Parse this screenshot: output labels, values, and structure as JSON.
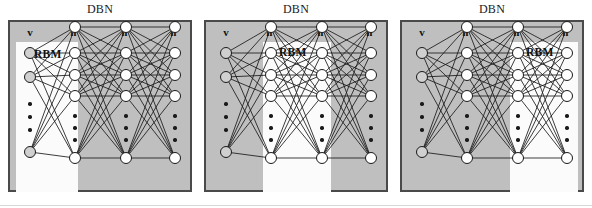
{
  "figure": {
    "width": 592,
    "height": 208,
    "background": "#ffffff",
    "caption_rule": true
  },
  "colors": {
    "panel_fill": "#bfbfbf",
    "panel_border": "#4a4a4a",
    "rbm_fill": "#fbfbfb",
    "visible_node_fill": "#d0d0d0",
    "hidden_node_fill": "#ffffff",
    "node_stroke": "#1a1a1a",
    "edge_stroke": "#1a1a1a",
    "text": "#111111"
  },
  "panels": [
    {
      "id": "panel-1",
      "title": "DBN",
      "rbm_label": "RBM",
      "rbm_span": [
        "v",
        "h1"
      ],
      "rbm_rect": {
        "x": 6,
        "y": 20,
        "w": 62,
        "h": 150
      },
      "rbm_label_pos": {
        "x": 24,
        "y": 26
      },
      "layers": [
        {
          "key": "v",
          "label": "v",
          "superscript": "",
          "x": 20,
          "type": "visible",
          "nodes_y": [
            31,
            55,
            130
          ],
          "dots_y": [
            82,
            95,
            108
          ]
        },
        {
          "key": "h1",
          "label": "h",
          "superscript": "1",
          "x": 65,
          "type": "hidden",
          "nodes_y": [
            5,
            31,
            53,
            74,
            136
          ],
          "dots_y": [
            94,
            106,
            118
          ]
        },
        {
          "key": "h2",
          "label": "h",
          "superscript": "2",
          "x": 116,
          "type": "hidden",
          "nodes_y": [
            5,
            31,
            53,
            74,
            136
          ],
          "dots_y": [
            94,
            106,
            118
          ]
        },
        {
          "key": "h3",
          "label": "h",
          "superscript": "3",
          "x": 165,
          "type": "hidden",
          "nodes_y": [
            5,
            31,
            53,
            74,
            136
          ],
          "dots_y": [
            94,
            106,
            118
          ]
        }
      ]
    },
    {
      "id": "panel-2",
      "title": "DBN",
      "rbm_label": "RBM",
      "rbm_span": [
        "h1",
        "h2"
      ],
      "rbm_rect": {
        "x": 57,
        "y": 20,
        "w": 68,
        "h": 150
      },
      "rbm_label_pos": {
        "x": 73,
        "y": 24
      },
      "layers": [
        {
          "key": "v",
          "label": "v",
          "superscript": "",
          "x": 20,
          "type": "visible",
          "nodes_y": [
            31,
            55,
            130
          ],
          "dots_y": [
            82,
            95,
            108
          ]
        },
        {
          "key": "h1",
          "label": "h",
          "superscript": "1",
          "x": 65,
          "type": "hidden",
          "nodes_y": [
            5,
            31,
            53,
            74,
            136
          ],
          "dots_y": [
            94,
            106,
            118
          ]
        },
        {
          "key": "h2",
          "label": "h",
          "superscript": "2",
          "x": 116,
          "type": "hidden",
          "nodes_y": [
            5,
            31,
            53,
            74,
            136
          ],
          "dots_y": [
            94,
            106,
            118
          ]
        },
        {
          "key": "h3",
          "label": "h",
          "superscript": "3",
          "x": 165,
          "type": "hidden",
          "nodes_y": [
            5,
            31,
            53,
            74,
            136
          ],
          "dots_y": [
            94,
            106,
            118
          ]
        }
      ]
    },
    {
      "id": "panel-3",
      "title": "DBN",
      "rbm_label": "RBM",
      "rbm_span": [
        "h2",
        "h3"
      ],
      "rbm_rect": {
        "x": 108,
        "y": 20,
        "w": 68,
        "h": 150
      },
      "rbm_label_pos": {
        "x": 124,
        "y": 24
      },
      "layers": [
        {
          "key": "v",
          "label": "v",
          "superscript": "",
          "x": 20,
          "type": "visible",
          "nodes_y": [
            31,
            55,
            130
          ],
          "dots_y": [
            82,
            95,
            108
          ]
        },
        {
          "key": "h1",
          "label": "h",
          "superscript": "1",
          "x": 65,
          "type": "hidden",
          "nodes_y": [
            5,
            31,
            53,
            74,
            136
          ],
          "dots_y": [
            94,
            106,
            118
          ]
        },
        {
          "key": "h2",
          "label": "h",
          "superscript": "2",
          "x": 116,
          "type": "hidden",
          "nodes_y": [
            5,
            31,
            53,
            74,
            136
          ],
          "dots_y": [
            94,
            106,
            118
          ]
        },
        {
          "key": "h3",
          "label": "h",
          "superscript": "3",
          "x": 165,
          "type": "hidden",
          "nodes_y": [
            5,
            31,
            53,
            74,
            136
          ],
          "dots_y": [
            94,
            106,
            118
          ]
        }
      ]
    }
  ],
  "panel_positions_x": [
    8,
    204,
    400
  ],
  "label_row_y": 8
}
